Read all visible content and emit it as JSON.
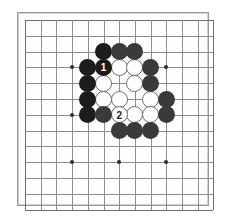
{
  "board": {
    "kind": "go-board-diagram",
    "size": 13,
    "line_color": "#8d8d8d",
    "edge_color": "#6f6f6f",
    "background_color": "#fdfdfd",
    "page_background": "#ffffff",
    "star_point_lines": [
      4,
      7,
      10
    ],
    "geometry": {
      "origin_x": 25,
      "origin_y": 20,
      "spacing_x": 15.7,
      "spacing_y": 15.8,
      "stone_diameter": 17
    },
    "colors": {
      "black_stone": "#1c1c1c",
      "black_stone_alt": "#3a3a3a",
      "white_stone": "#fefefe",
      "white_stone_outline": "#6a6a6a",
      "black_label_text": "#ffffff",
      "white_label_text": "#1c1c1c"
    },
    "stones": [
      {
        "color": "black",
        "col": 6,
        "row": 3,
        "shade": "dark",
        "label": ""
      },
      {
        "color": "black",
        "col": 7,
        "row": 3,
        "shade": "alt",
        "label": ""
      },
      {
        "color": "black",
        "col": 8,
        "row": 3,
        "shade": "alt",
        "label": ""
      },
      {
        "color": "black",
        "col": 5,
        "row": 4,
        "shade": "dark",
        "label": ""
      },
      {
        "color": "black",
        "col": 6,
        "row": 4,
        "shade": "dark",
        "label": "1"
      },
      {
        "color": "white",
        "col": 7,
        "row": 4,
        "shade": "",
        "label": ""
      },
      {
        "color": "white",
        "col": 8,
        "row": 4,
        "shade": "",
        "label": ""
      },
      {
        "color": "black",
        "col": 9,
        "row": 4,
        "shade": "alt",
        "label": ""
      },
      {
        "color": "black",
        "col": 5,
        "row": 5,
        "shade": "dark",
        "label": ""
      },
      {
        "color": "white",
        "col": 6,
        "row": 5,
        "shade": "",
        "label": ""
      },
      {
        "color": "white",
        "col": 8,
        "row": 5,
        "shade": "",
        "label": ""
      },
      {
        "color": "black",
        "col": 9,
        "row": 5,
        "shade": "alt",
        "label": ""
      },
      {
        "color": "black",
        "col": 5,
        "row": 6,
        "shade": "dark",
        "label": ""
      },
      {
        "color": "white",
        "col": 6,
        "row": 6,
        "shade": "",
        "label": ""
      },
      {
        "color": "white",
        "col": 7,
        "row": 6,
        "shade": "",
        "label": ""
      },
      {
        "color": "white",
        "col": 9,
        "row": 6,
        "shade": "",
        "label": ""
      },
      {
        "color": "black",
        "col": 10,
        "row": 6,
        "shade": "alt",
        "label": ""
      },
      {
        "color": "black",
        "col": 5,
        "row": 7,
        "shade": "dark",
        "label": ""
      },
      {
        "color": "black",
        "col": 6,
        "row": 7,
        "shade": "alt",
        "label": ""
      },
      {
        "color": "white",
        "col": 7,
        "row": 7,
        "shade": "",
        "label": "2"
      },
      {
        "color": "white",
        "col": 8,
        "row": 7,
        "shade": "",
        "label": ""
      },
      {
        "color": "white",
        "col": 9,
        "row": 7,
        "shade": "",
        "label": ""
      },
      {
        "color": "black",
        "col": 10,
        "row": 7,
        "shade": "alt",
        "label": ""
      },
      {
        "color": "black",
        "col": 7,
        "row": 8,
        "shade": "alt",
        "label": ""
      },
      {
        "color": "black",
        "col": 8,
        "row": 8,
        "shade": "alt",
        "label": ""
      },
      {
        "color": "black",
        "col": 9,
        "row": 8,
        "shade": "alt",
        "label": ""
      }
    ],
    "move_markers": [
      {
        "number": "1",
        "stone_color": "black"
      },
      {
        "number": "2",
        "stone_color": "white"
      }
    ]
  }
}
